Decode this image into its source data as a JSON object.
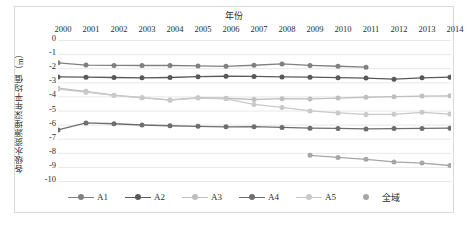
{
  "chart_data": {
    "type": "line",
    "title": "",
    "xlabel": "年份",
    "ylabel": "各级水资源埋深年平均值（m）",
    "x": [
      2000,
      2001,
      2002,
      2003,
      2004,
      2005,
      2006,
      2007,
      2008,
      2009,
      2010,
      2011,
      2012,
      2013,
      2014
    ],
    "xticklabels": [
      "2000",
      "2001",
      "2002",
      "2003",
      "2004",
      "2005",
      "2006",
      "2007",
      "2008",
      "2009",
      "2010",
      "2011",
      "2012",
      "2013",
      "2014"
    ],
    "yticklabels": [
      "0",
      "-1",
      "-2",
      "-3",
      "-4",
      "-5",
      "-6",
      "-7",
      "-8",
      "-9",
      "-10"
    ],
    "ylim": [
      -10,
      0
    ],
    "xlim": [
      2000,
      2014
    ],
    "grid": "horizontal",
    "legend_position": "bottom",
    "axis_position": "x-axis-on-top",
    "series": [
      {
        "name": "A1",
        "color": "#808080",
        "values": [
          -1.62,
          -1.78,
          -1.8,
          -1.81,
          -1.81,
          -1.84,
          -1.87,
          -1.79,
          -1.7,
          -1.8,
          -1.86,
          -1.93,
          null,
          null,
          null
        ]
      },
      {
        "name": "A2",
        "color": "#595959",
        "values": [
          -2.62,
          -2.64,
          -2.66,
          -2.68,
          -2.66,
          -2.6,
          -2.57,
          -2.58,
          -2.62,
          -2.64,
          -2.67,
          -2.7,
          -2.78,
          -2.68,
          -2.64
        ]
      },
      {
        "name": "A3",
        "color": "#bfbfbf",
        "values": [
          -3.42,
          -3.64,
          -3.91,
          -4.09,
          -4.25,
          -4.09,
          -4.13,
          -4.22,
          -4.16,
          -4.18,
          -4.12,
          -4.06,
          -4.02,
          -3.98,
          -3.96
        ]
      },
      {
        "name": "A4",
        "color": "#6e6e6e",
        "values": [
          -6.38,
          -5.88,
          -5.94,
          -6.03,
          -6.08,
          -6.12,
          -6.16,
          -6.15,
          -6.2,
          -6.25,
          -6.27,
          -6.31,
          -6.28,
          -6.27,
          -6.25
        ]
      },
      {
        "name": "A5",
        "color": "#c9c9c9",
        "values": [
          -3.48,
          -3.7,
          -3.93,
          -4.1,
          -4.27,
          -4.12,
          -4.17,
          -4.57,
          -4.78,
          -5.03,
          -5.17,
          -5.28,
          -5.27,
          -5.13,
          -5.25
        ]
      },
      {
        "name": "全域",
        "color": "#a6a6a6",
        "values": [
          null,
          null,
          null,
          null,
          null,
          null,
          null,
          null,
          null,
          -8.18,
          -8.33,
          -8.46,
          -8.65,
          -8.73,
          -8.9
        ]
      }
    ]
  },
  "legend": {
    "items": [
      {
        "label": "A1",
        "marker": "line-dot"
      },
      {
        "label": "A2",
        "marker": "line-dot"
      },
      {
        "label": "A3",
        "marker": "line-dot"
      },
      {
        "label": "A4",
        "marker": "line-dot"
      },
      {
        "label": "A5",
        "marker": "line-dot"
      },
      {
        "label": "全域",
        "marker": "dot-only"
      }
    ]
  },
  "style": {
    "frame_color": "#d9d9d9",
    "grid_color": "#e8e8e8",
    "text_color": "#2b2b2b",
    "background": "#ffffff"
  }
}
